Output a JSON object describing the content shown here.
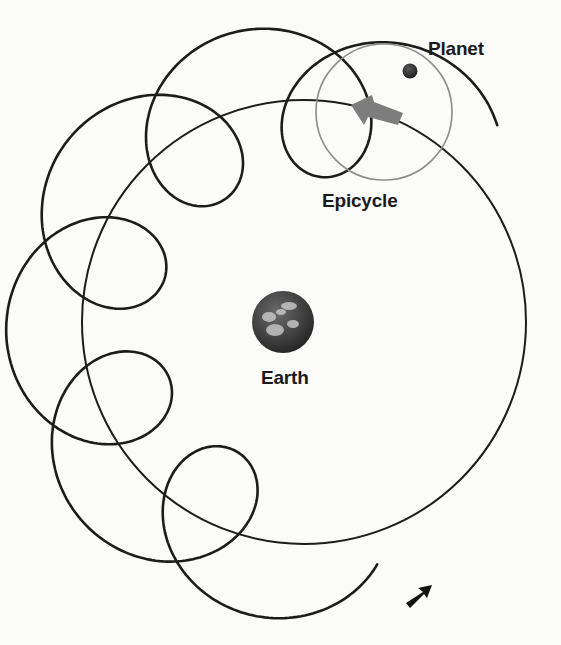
{
  "diagram": {
    "labels": {
      "planet": "Planet",
      "epicycle": "Epicycle",
      "earth": "Earth"
    },
    "colors": {
      "background": "#fbfbfa",
      "path": "#1c1c1c",
      "epicycle_circle": "#8c8c8c",
      "planet": "#2b2b2b",
      "arrow_gray": "#7a7a7a",
      "earth_dark": "#2e2e2e",
      "earth_light": "#bdbdbd",
      "label_text": "#1a1a1a"
    },
    "geometry": {
      "deferent": {
        "cx": 304,
        "cy": 322,
        "r": 222
      },
      "epicycle": {
        "cx": 384,
        "cy": 112,
        "r": 68
      },
      "planet": {
        "cx": 410,
        "cy": 71,
        "r": 7.5
      },
      "earth": {
        "cx": 283,
        "cy": 322,
        "r": 31
      },
      "loops": 5
    },
    "elements": [
      "deferent-circle",
      "epicycle-circle",
      "planet",
      "earth",
      "looped-path",
      "direction-arrow-gray",
      "path-end-arrow"
    ]
  }
}
